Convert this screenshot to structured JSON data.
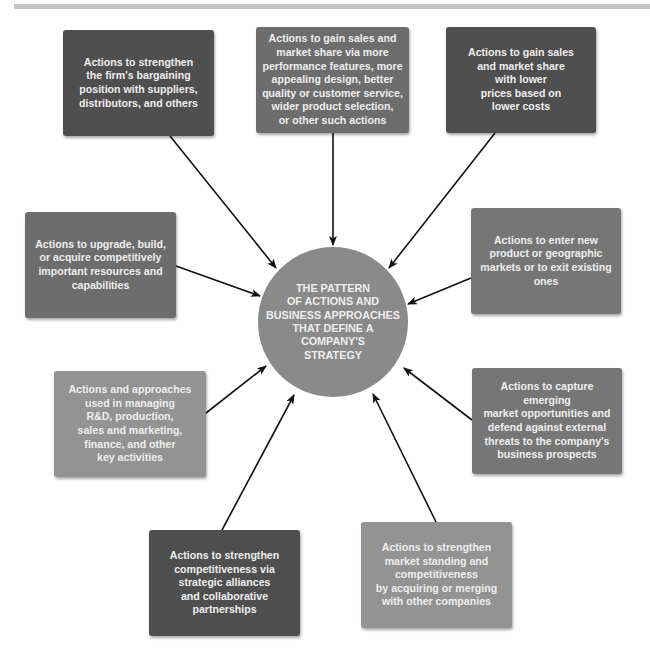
{
  "diagram": {
    "type": "hub-and-spoke",
    "center": {
      "label": "THE PATTERN\nOF ACTIONS AND\nBUSINESS APPROACHES\nTHAT DEFINE A\nCOMPANY'S\nSTRATEGY"
    },
    "nodes": [
      {
        "id": "bargaining",
        "label": "Actions to strengthen\nthe firm's bargaining\nposition with suppliers,\ndistributors, and others"
      },
      {
        "id": "differentiation",
        "label": "Actions to gain sales and\nmarket share via more\nperformance features, more\nappealing design, better\nquality or customer service,\nwider product selection,\nor other such actions"
      },
      {
        "id": "low-cost",
        "label": "Actions to gain sales\nand market share\nwith lower\nprices based on\nlower costs"
      },
      {
        "id": "resources",
        "label": "Actions to upgrade, build,\nor acquire competitively\nimportant resources and\ncapabilities"
      },
      {
        "id": "markets",
        "label": "Actions to enter new\nproduct or geographic\nmarkets or to exit existing\nones"
      },
      {
        "id": "functional",
        "label": "Actions and approaches\nused in managing\nR&D, production,\nsales and marketing,\nfinance, and other\nkey activities"
      },
      {
        "id": "opportunities",
        "label": "Actions to capture emerging\nmarket opportunities and\ndefend against external\nthreats to the company's\nbusiness prospects"
      },
      {
        "id": "alliances",
        "label": "Actions to strengthen\ncompetitiveness via\nstrategic alliances\nand collaborative\npartnerships"
      },
      {
        "id": "mergers",
        "label": "Actions to strengthen\nmarket standing and\ncompetitiveness\nby acquiring or merging\nwith other companies"
      }
    ],
    "edges": [
      {
        "from": "bargaining",
        "to": "center"
      },
      {
        "from": "differentiation",
        "to": "center"
      },
      {
        "from": "low-cost",
        "to": "center"
      },
      {
        "from": "resources",
        "to": "center"
      },
      {
        "from": "markets",
        "to": "center"
      },
      {
        "from": "functional",
        "to": "center"
      },
      {
        "from": "opportunities",
        "to": "center"
      },
      {
        "from": "alliances",
        "to": "center"
      },
      {
        "from": "mergers",
        "to": "center"
      }
    ],
    "colors": {
      "dark_box": "#4f4f4f",
      "mid_box": "#6d6d6d",
      "light_box": "#939393",
      "circle": "#8a8a8a",
      "text": "#eeeeee",
      "arrow": "#111111",
      "top_rule": "#c4c4c4"
    }
  }
}
